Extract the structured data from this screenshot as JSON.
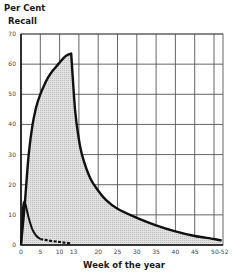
{
  "chart_data": {
    "type": "line",
    "title": "",
    "ylabel": "Per Cent Recall",
    "ylabel_line1": "Per Cent",
    "ylabel_line2": "Recall",
    "xlabel": "Week of the year",
    "ylim": [
      0,
      70
    ],
    "xlim": [
      0,
      52
    ],
    "grid": true,
    "y_ticks": [
      "0",
      "10",
      "20",
      "30",
      "40",
      "50",
      "60",
      "70"
    ],
    "x_ticks": [
      "0",
      "5",
      "10",
      "13",
      "20",
      "25",
      "30",
      "35",
      "40",
      "45",
      "50-52"
    ],
    "series": [
      {
        "name": "Recall with 13 weekly exposures (shaded, solid)",
        "style": "solid",
        "x": [
          0,
          1,
          2,
          3,
          4,
          5,
          6,
          7,
          8,
          9,
          10,
          11,
          12,
          13,
          14,
          15,
          16,
          18,
          20,
          22,
          25,
          30,
          35,
          40,
          45,
          50,
          52
        ],
        "values": [
          0,
          14,
          30,
          40,
          46,
          50,
          53,
          55.5,
          57.5,
          59,
          60.5,
          62,
          63,
          63.5,
          45,
          35,
          29,
          22,
          18,
          15,
          12,
          9,
          6.5,
          4.5,
          3,
          2,
          1.5
        ]
      },
      {
        "name": "Recall after single exposure (solid then dashed)",
        "style": "solid-then-dashed",
        "x": [
          0,
          0.5,
          1,
          2,
          3,
          4,
          5,
          7,
          10,
          13
        ],
        "values": [
          0,
          12,
          14,
          9,
          5,
          3,
          2,
          1.5,
          1,
          0.5
        ]
      }
    ]
  }
}
